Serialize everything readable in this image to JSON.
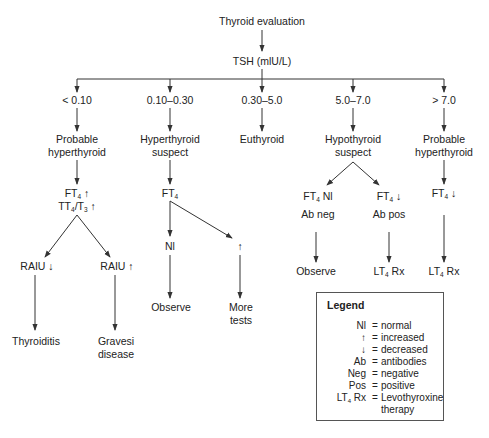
{
  "diagram": {
    "title": "Thyroid evaluation",
    "test": "TSH (mlU/L)",
    "colors": {
      "line": "#333333",
      "text": "#222222",
      "background": "#ffffff"
    },
    "branches": [
      {
        "range": "< 0.10",
        "assessment": [
          "Probable",
          "hyperthyroid"
        ],
        "test": [
          "FT4 ↑",
          "TT4/T3 ↑"
        ],
        "sub_branches": [
          {
            "result": "RAIU ↓",
            "outcome": [
              "Thyroiditis"
            ]
          },
          {
            "result": "RAIU ↑",
            "outcome": [
              "Gravesi",
              "disease"
            ]
          }
        ]
      },
      {
        "range": "0.10–0.30",
        "assessment": [
          "Hyperthyroid",
          "suspect"
        ],
        "test": [
          "FT4"
        ],
        "sub_branches": [
          {
            "result": "Nl",
            "outcome": [
              "Observe"
            ]
          },
          {
            "result": "↑",
            "outcome": [
              "More",
              "tests"
            ]
          }
        ]
      },
      {
        "range": "0.30–5.0",
        "assessment": [
          "Euthyroid"
        ]
      },
      {
        "range": "5.0–7.0",
        "assessment": [
          "Hypothyroid",
          "suspect"
        ],
        "sub_branches": [
          {
            "result": [
              "FT4 Nl",
              "Ab neg"
            ],
            "outcome": [
              "Observe"
            ]
          },
          {
            "result": [
              "FT4 ↓",
              "Ab pos"
            ],
            "outcome": [
              "LT4 Rx"
            ]
          }
        ]
      },
      {
        "range": "> 7.0",
        "assessment": [
          "Probable",
          "hyperthyroid"
        ],
        "test": [
          "FT4 ↓"
        ],
        "outcome": [
          "LT4 Rx"
        ]
      }
    ]
  },
  "legend": {
    "title": "Legend",
    "items": [
      {
        "key": "Nl",
        "eq": "=",
        "value": "normal"
      },
      {
        "key": "↑",
        "eq": "=",
        "value": "increased"
      },
      {
        "key": "↓",
        "eq": "=",
        "value": "decreased"
      },
      {
        "key": "Ab",
        "eq": "=",
        "value": "antibodies"
      },
      {
        "key": "Neg",
        "eq": "=",
        "value": "negative"
      },
      {
        "key": "Pos",
        "eq": "=",
        "value": "positive"
      },
      {
        "key": "LT4 Rx",
        "eq": "=",
        "value": "Levothyroxine",
        "value2": "therapy"
      }
    ]
  }
}
